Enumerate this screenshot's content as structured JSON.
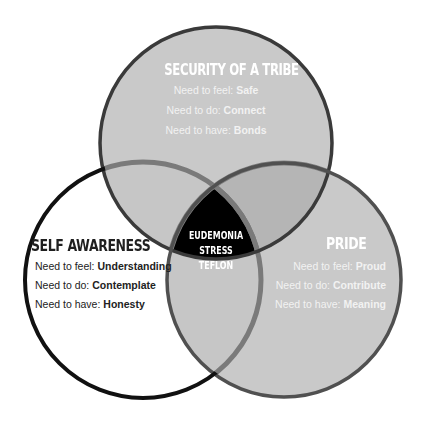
{
  "diagram": {
    "type": "venn",
    "colors": {
      "circle_fill": "#c9c9c9",
      "overlap_fill": "#b3b3b3",
      "top_stroke": "#3a3a3a",
      "left_stroke": "#111111",
      "right_stroke": "#4a4a4a",
      "inner_arc": "#7a7a7a",
      "center_fill": "#000000"
    },
    "circles": {
      "top": {
        "title": "SECURITY OF A TRIBE",
        "feel_label": "Need to feel:",
        "feel_value": "Safe",
        "do_label": "Need to do:",
        "do_value": "Connect",
        "have_label": "Need to have:",
        "have_value": "Bonds"
      },
      "left": {
        "title": "SELF AWARENESS",
        "feel_label": "Need to feel:",
        "feel_value": "Understanding",
        "do_label": "Need to do:",
        "do_value": "Contemplate",
        "have_label": "Need to have:",
        "have_value": "Honesty"
      },
      "right": {
        "title": "PRIDE",
        "feel_label": "Need to feel:",
        "feel_value": "Proud",
        "do_label": "Need to do:",
        "do_value": "Contribute",
        "have_label": "Need to have:",
        "have_value": "Meaning"
      }
    },
    "center": {
      "line1": "EUDEMONIA",
      "line2": "STRESS TEFLON"
    }
  }
}
